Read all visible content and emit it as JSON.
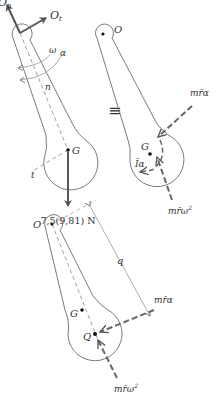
{
  "diagram": {
    "colors": {
      "outline": "#6b6b6b",
      "force_arrow": "#555555",
      "dashed_force": "#666666",
      "text": "#333333",
      "background": "#ffffff"
    },
    "free_body": {
      "pivot_label": "O",
      "reaction_normal_label": "O",
      "reaction_normal_subscript": "n",
      "reaction_tangential_label": "O",
      "reaction_tangential_subscript": "t",
      "angular_velocity_label": "ω",
      "angular_accel_label": "α",
      "normal_axis_label": "n",
      "tangential_axis_label": "t",
      "center_label": "G",
      "weight_label": "7,5(9,81) N"
    },
    "equivalence_symbol": "≡",
    "kinetic": {
      "pivot_label": "O",
      "center_label": "G",
      "tangential_inertia_label": "mr̄α",
      "normal_inertia_label": "mr̄ω",
      "normal_inertia_exponent": "2",
      "moment_label": "Īα"
    },
    "percussion": {
      "pivot_label": "O",
      "distance_label": "q",
      "center_label": "G",
      "percussion_point_label": "Q",
      "tangential_inertia_label": "mr̄α",
      "normal_inertia_label": "mr̄ω",
      "normal_inertia_exponent": "2"
    }
  }
}
